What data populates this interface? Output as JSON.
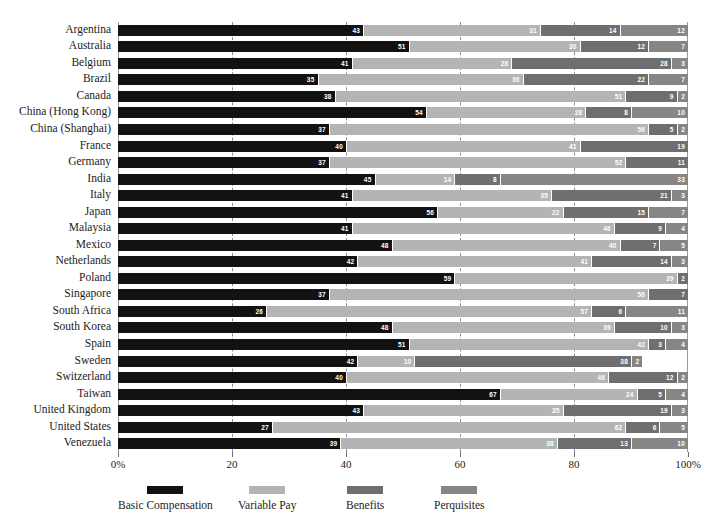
{
  "chart_data": {
    "type": "bar",
    "orientation": "horizontal",
    "stacked": true,
    "normalized_percent": true,
    "title": "",
    "xlabel": "",
    "ylabel": "",
    "xlim": [
      0,
      100
    ],
    "grid": true,
    "gridline_values": [
      20,
      40,
      60,
      80
    ],
    "legend_position": "bottom",
    "xticks": [
      0,
      20,
      40,
      60,
      80,
      100
    ],
    "xticklabels": [
      "0%",
      "20",
      "40",
      "60",
      "80",
      "100%"
    ],
    "categories": [
      "Argentina",
      "Australia",
      "Belgium",
      "Brazil",
      "Canada",
      "China (Hong Kong)",
      "China (Shanghai)",
      "France",
      "Germany",
      "India",
      "Italy",
      "Japan",
      "Malaysia",
      "Mexico",
      "Netherlands",
      "Poland",
      "Singapore",
      "South Africa",
      "South Korea",
      "Spain",
      "Sweden",
      "Switzerland",
      "Taiwan",
      "United Kingdom",
      "United States",
      "Venezuela"
    ],
    "series": [
      {
        "name": "Basic Compensation",
        "color": "#121212",
        "values": [
          43,
          51,
          41,
          35,
          38,
          54,
          37,
          40,
          37,
          45,
          41,
          56,
          41,
          48,
          42,
          59,
          37,
          26,
          48,
          51,
          42,
          40,
          67,
          43,
          27,
          39
        ]
      },
      {
        "name": "Variable Pay",
        "color": "#b4b4b4",
        "values": [
          31,
          30,
          28,
          36,
          51,
          28,
          56,
          41,
          52,
          14,
          35,
          22,
          46,
          40,
          41,
          39,
          56,
          57,
          39,
          42,
          10,
          46,
          24,
          35,
          62,
          38
        ]
      },
      {
        "name": "Benefits",
        "color": "#6f6f6f",
        "values": [
          14,
          12,
          28,
          22,
          9,
          8,
          5,
          19,
          11,
          8,
          21,
          15,
          9,
          7,
          14,
          2,
          7,
          6,
          10,
          3,
          38,
          12,
          5,
          19,
          6,
          13
        ]
      },
      {
        "name": "Perquisites",
        "color": "#868686",
        "values": [
          12,
          7,
          3,
          7,
          2,
          10,
          2,
          0,
          0,
          33,
          3,
          7,
          4,
          5,
          3,
          0,
          0,
          11,
          3,
          4,
          2,
          2,
          4,
          3,
          5,
          10
        ]
      }
    ]
  },
  "legend": {
    "items": [
      {
        "label": "Basic Compensation",
        "key": "basic"
      },
      {
        "label": "Variable Pay",
        "key": "variable"
      },
      {
        "label": "Benefits",
        "key": "benefits"
      },
      {
        "label": "Perquisites",
        "key": "perqs"
      }
    ]
  }
}
